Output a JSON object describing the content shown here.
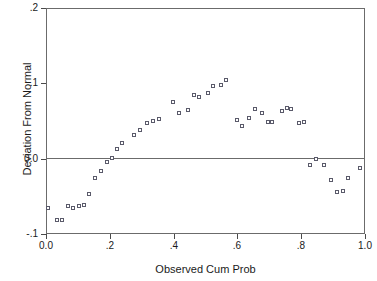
{
  "chart_data": {
    "type": "scatter",
    "title": "",
    "xlabel": "Observed Cum Prob",
    "ylabel": "Deviation From Normal",
    "xlim": [
      0.0,
      1.0
    ],
    "ylim": [
      -0.1,
      0.2
    ],
    "grid": false,
    "legend": null,
    "xticks": [
      "0.0",
      ".2",
      ".4",
      ".6",
      ".8",
      "1.0"
    ],
    "xtick_values": [
      0.0,
      0.2,
      0.4,
      0.6,
      0.8,
      1.0
    ],
    "yticks": [
      ".2",
      ".1",
      "0.0",
      "-.1"
    ],
    "ytick_values": [
      0.2,
      0.1,
      0.0,
      -0.1
    ],
    "reference_line": 0.0,
    "marker": "open-square",
    "marker_color": "#5a5a6a",
    "frame_color": "#6b6b6b",
    "points": [
      {
        "x": 0.006,
        "y": -0.065
      },
      {
        "x": 0.034,
        "y": -0.081
      },
      {
        "x": 0.05,
        "y": -0.081
      },
      {
        "x": 0.069,
        "y": -0.063
      },
      {
        "x": 0.085,
        "y": -0.066
      },
      {
        "x": 0.104,
        "y": -0.063
      },
      {
        "x": 0.119,
        "y": -0.062
      },
      {
        "x": 0.135,
        "y": -0.047
      },
      {
        "x": 0.154,
        "y": -0.025
      },
      {
        "x": 0.172,
        "y": -0.016
      },
      {
        "x": 0.191,
        "y": -0.005
      },
      {
        "x": 0.207,
        "y": 0.001
      },
      {
        "x": 0.223,
        "y": 0.013
      },
      {
        "x": 0.238,
        "y": 0.021
      },
      {
        "x": 0.276,
        "y": 0.032
      },
      {
        "x": 0.295,
        "y": 0.038
      },
      {
        "x": 0.317,
        "y": 0.047
      },
      {
        "x": 0.335,
        "y": 0.05
      },
      {
        "x": 0.354,
        "y": 0.052
      },
      {
        "x": 0.398,
        "y": 0.075
      },
      {
        "x": 0.417,
        "y": 0.06
      },
      {
        "x": 0.445,
        "y": 0.064
      },
      {
        "x": 0.464,
        "y": 0.084
      },
      {
        "x": 0.48,
        "y": 0.082
      },
      {
        "x": 0.508,
        "y": 0.087
      },
      {
        "x": 0.524,
        "y": 0.096
      },
      {
        "x": 0.549,
        "y": 0.098
      },
      {
        "x": 0.565,
        "y": 0.105
      },
      {
        "x": 0.599,
        "y": 0.051
      },
      {
        "x": 0.615,
        "y": 0.044
      },
      {
        "x": 0.637,
        "y": 0.054
      },
      {
        "x": 0.655,
        "y": 0.066
      },
      {
        "x": 0.677,
        "y": 0.06
      },
      {
        "x": 0.696,
        "y": 0.049
      },
      {
        "x": 0.709,
        "y": 0.049
      },
      {
        "x": 0.74,
        "y": 0.063
      },
      {
        "x": 0.756,
        "y": 0.067
      },
      {
        "x": 0.768,
        "y": 0.066
      },
      {
        "x": 0.793,
        "y": 0.047
      },
      {
        "x": 0.809,
        "y": 0.049
      },
      {
        "x": 0.828,
        "y": -0.009
      },
      {
        "x": 0.847,
        "y": -0.001
      },
      {
        "x": 0.872,
        "y": -0.009
      },
      {
        "x": 0.894,
        "y": -0.028
      },
      {
        "x": 0.913,
        "y": -0.044
      },
      {
        "x": 0.931,
        "y": -0.043
      },
      {
        "x": 0.947,
        "y": -0.025
      },
      {
        "x": 0.985,
        "y": -0.013
      }
    ]
  }
}
